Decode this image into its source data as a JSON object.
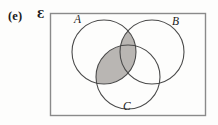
{
  "figure": {
    "part_label": "(e)",
    "universal_set_symbol": "Ɛ",
    "universal_set_name": "epsilon-universal-set",
    "caption_type": "venn-diagram-three-sets",
    "shaded_description": "A ∩ (B ∪ C)"
  },
  "sets": [
    {
      "id": "A",
      "label": "A",
      "cx": 104,
      "cy": 52,
      "r": 32
    },
    {
      "id": "B",
      "label": "B",
      "cx": 152,
      "cy": 52,
      "r": 32
    },
    {
      "id": "C",
      "label": "C",
      "cx": 128,
      "cy": 77,
      "r": 32
    }
  ],
  "universe_rect": {
    "x": 50,
    "y": 13,
    "width": 155,
    "height": 102
  },
  "colors": {
    "shade": "#b9b6b3",
    "stroke": "#4a4a4a",
    "rect_stroke": "#8a8a8a",
    "background": "#fdfdfc",
    "text": "#1a1a1a"
  },
  "shaded_regions": [
    {
      "name": "A-intersect-B",
      "sets": [
        "A",
        "B"
      ]
    },
    {
      "name": "A-intersect-C",
      "sets": [
        "A",
        "C"
      ]
    }
  ],
  "icons": {
    "venn_circle": "circle-outline-icon"
  }
}
